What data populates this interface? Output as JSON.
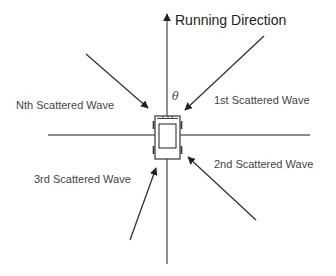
{
  "diagram": {
    "title": "Running Direction",
    "angle_symbol": "θ",
    "waves": [
      {
        "label": "Nth Scattered Wave",
        "from": [
          86,
          54
        ],
        "to": [
          148,
          108
        ]
      },
      {
        "label": "1st Scattered Wave",
        "from": [
          264,
          36
        ],
        "to": [
          185,
          110
        ]
      },
      {
        "label": "2nd Scattered Wave",
        "from": [
          256,
          220
        ],
        "to": [
          188,
          157
        ]
      },
      {
        "label": "3rd Scattered Wave",
        "from": [
          130,
          240
        ],
        "to": [
          156,
          168
        ]
      }
    ],
    "axes": {
      "vertical": {
        "x": 167,
        "y1": 264,
        "y2": 12
      },
      "horizontal": {
        "y": 135,
        "x1": 48,
        "x2": 310
      }
    },
    "colors": {
      "line": "#555555",
      "arrow": "#333333",
      "text": "#444444",
      "background": "#ffffff"
    }
  }
}
